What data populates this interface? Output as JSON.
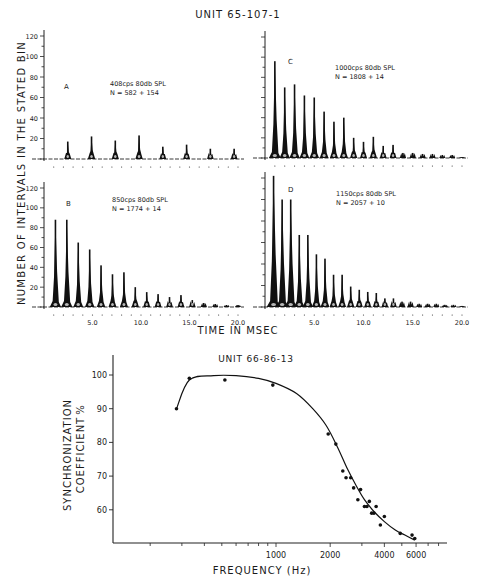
{
  "figure_top": {
    "title": "UNIT 65-107-1",
    "ylabel": "NUMBER OF INTERVALS IN THE STATED BIN",
    "xlabel": "TIME IN MSEC",
    "yticks": [
      "20",
      "40",
      "60",
      "80",
      "100",
      "120"
    ],
    "xticks": [
      "5.0",
      "10.0",
      "15.0",
      "20.0"
    ]
  },
  "figure_bottom": {
    "title": "UNIT 66-86-13",
    "ylabel_line1": "SYNCHRONIZATION",
    "ylabel_line2": "COEFFICIENT",
    "ylabel_unit": "%",
    "xlabel": "FREQUENCY (Hz)",
    "yticks": [
      "60",
      "70",
      "80",
      "90",
      "100"
    ],
    "xticks": [
      "1000",
      "2000",
      "4000",
      "6000"
    ]
  },
  "chart_data": [
    {
      "type": "bar",
      "panel": "A",
      "title": "408cps 80db SPL",
      "subtitle": "N = 582 + 154",
      "xlabel": "TIME IN MSEC",
      "ylabel": "NUMBER OF INTERVALS IN THE STATED BIN",
      "ylim": [
        0,
        120
      ],
      "xlim": [
        0,
        20
      ],
      "peak_times_ms": [
        2.45,
        4.9,
        7.35,
        9.8,
        12.25,
        14.7,
        17.15,
        19.6
      ],
      "values": [
        17,
        22,
        18,
        23,
        12,
        14,
        10,
        10
      ]
    },
    {
      "type": "bar",
      "panel": "B",
      "title": "850cps 80db SPL",
      "subtitle": "N = 1774 + 14",
      "xlabel": "TIME IN MSEC",
      "ylabel": "NUMBER OF INTERVALS IN THE STATED BIN",
      "ylim": [
        0,
        120
      ],
      "xlim": [
        0,
        20
      ],
      "peak_times_ms": [
        1.18,
        2.35,
        3.53,
        4.71,
        5.88,
        7.06,
        8.24,
        9.41,
        10.59,
        11.76,
        12.94,
        14.12,
        15.29,
        16.47,
        17.65,
        18.82,
        20.0
      ],
      "values": [
        88,
        88,
        65,
        58,
        42,
        33,
        35,
        20,
        15,
        13,
        10,
        12,
        7,
        4,
        3,
        2,
        2
      ]
    },
    {
      "type": "bar",
      "panel": "C",
      "title": "1000cps 80db SPL",
      "subtitle": "N = 1808 + 14",
      "xlabel": "TIME IN MSEC",
      "ylabel": "NUMBER OF INTERVALS IN THE STATED BIN",
      "ylim": [
        0,
        120
      ],
      "xlim": [
        0,
        20
      ],
      "peak_times_ms": [
        1,
        2,
        3,
        4,
        5,
        6,
        7,
        8,
        9,
        10,
        11,
        12,
        13,
        14,
        15,
        16,
        17,
        18,
        19,
        20
      ],
      "values": [
        96,
        70,
        73,
        62,
        60,
        46,
        36,
        40,
        20,
        16,
        21,
        12,
        13,
        5,
        5,
        4,
        4,
        3,
        3,
        1
      ]
    },
    {
      "type": "bar",
      "panel": "D",
      "title": "1150cps 80db SPL",
      "subtitle": "N = 2057 + 10",
      "xlabel": "TIME IN MSEC",
      "ylabel": "NUMBER OF INTERVALS IN THE STATED BIN",
      "ylim": [
        0,
        120
      ],
      "xlim": [
        0,
        20
      ],
      "peak_times_ms": [
        0.87,
        1.74,
        2.61,
        3.48,
        4.35,
        5.22,
        6.09,
        6.96,
        7.83,
        8.7,
        9.57,
        10.43,
        11.3,
        12.17,
        13.04,
        13.91,
        14.78,
        15.65,
        16.52,
        17.39,
        18.26,
        19.13,
        20.0
      ],
      "values": [
        122,
        100,
        100,
        67,
        67,
        49,
        45,
        30,
        30,
        19,
        16,
        14,
        13,
        8,
        8,
        5,
        5,
        3,
        3,
        3,
        2,
        2,
        1
      ]
    },
    {
      "type": "line",
      "title": "UNIT 66-86-13",
      "xlabel": "FREQUENCY (Hz)",
      "ylabel": "SYNCHRONIZATION COEFFICIENT %",
      "xscale": "log",
      "ylim": [
        50,
        105
      ],
      "xticks": [
        1000,
        2000,
        4000,
        6000
      ],
      "yticks": [
        60,
        70,
        80,
        90,
        100
      ],
      "points": {
        "x": [
          280,
          330,
          520,
          960,
          1950,
          2150,
          2350,
          2450,
          2600,
          2700,
          2850,
          2950,
          3100,
          3200,
          3300,
          3400,
          3500,
          3600,
          3800,
          4000,
          4900,
          5700,
          5900
        ],
        "y": [
          90,
          99,
          98.5,
          97,
          82.5,
          79.5,
          71.5,
          69.5,
          69.5,
          66.5,
          63,
          66,
          61,
          61,
          62.5,
          59,
          59,
          61,
          55.5,
          58,
          53,
          52.5,
          51.5
        ]
      },
      "fit_curve": {
        "x": [
          280,
          330,
          450,
          600,
          800,
          1000,
          1300,
          1600,
          1900,
          2200,
          2500,
          2800,
          3100,
          3500,
          4000,
          4600,
          5200,
          5900
        ],
        "y": [
          90,
          98.5,
          99.8,
          99.8,
          99,
          97.5,
          94.5,
          90,
          85,
          78.5,
          72,
          67,
          63,
          59.5,
          56.5,
          54,
          52.5,
          51
        ]
      }
    }
  ]
}
